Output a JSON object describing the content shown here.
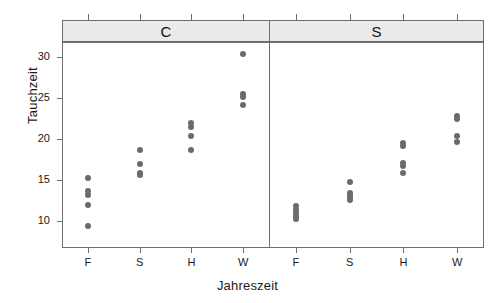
{
  "chart_data": {
    "type": "scatter",
    "title": "",
    "xlabel": "Jahreszeit",
    "ylabel": "Tauchzeit",
    "ylim": [
      8.2,
      31.6
    ],
    "yticks": [
      10,
      15,
      20,
      25,
      30
    ],
    "categories": [
      "F",
      "S",
      "H",
      "W"
    ],
    "grid": false,
    "legend": null,
    "panels": [
      {
        "label": "C",
        "groups": [
          {
            "category": "F",
            "values": [
              15.3,
              13.6,
              13.2,
              12.0,
              9.4
            ]
          },
          {
            "category": "S",
            "values": [
              18.7,
              16.9,
              15.9,
              15.6
            ]
          },
          {
            "category": "H",
            "values": [
              21.9,
              21.5,
              20.4,
              18.7
            ]
          },
          {
            "category": "W",
            "values": [
              30.4,
              25.5,
              25.1,
              24.2
            ]
          }
        ]
      },
      {
        "label": "S",
        "groups": [
          {
            "category": "F",
            "values": [
              11.8,
              11.4,
              11.0,
              10.6,
              10.3
            ]
          },
          {
            "category": "S",
            "values": [
              14.7,
              13.4,
              13.1,
              12.8,
              12.6
            ]
          },
          {
            "category": "H",
            "values": [
              19.5,
              19.1,
              17.1,
              16.7,
              15.9
            ]
          },
          {
            "category": "W",
            "values": [
              22.8,
              22.4,
              20.4,
              19.6
            ]
          }
        ]
      }
    ]
  },
  "axes": {
    "ytick_labels": [
      "30",
      "25",
      "20",
      "15",
      "10"
    ],
    "xtick_labels_panel_c": [
      "F",
      "S",
      "H",
      "W"
    ],
    "xtick_labels_panel_s": [
      "F",
      "S",
      "H",
      "W"
    ]
  },
  "panel_headers": {
    "left": "C",
    "right": "S"
  },
  "colors": {
    "point": "#6b6b6b",
    "strip_background": "#eaeaea",
    "frame": "#6e6e6e",
    "text": "#1a1a1a",
    "background": "#ffffff"
  }
}
